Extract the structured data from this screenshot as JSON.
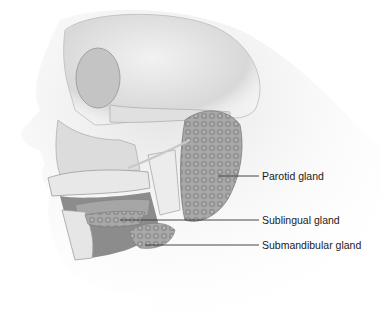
{
  "figure": {
    "labels": [
      {
        "id": "parotid",
        "text": "Parotid gland",
        "x": 262,
        "y": 170,
        "line": {
          "x1": 218,
          "x2": 259,
          "y": 176
        }
      },
      {
        "id": "sublingual",
        "text": "Sublingual gland",
        "x": 262,
        "y": 214,
        "line": {
          "x1": 120,
          "x2": 259,
          "y": 220
        }
      },
      {
        "id": "submandibular",
        "text": "Submandibular gland",
        "x": 262,
        "y": 238,
        "line": {
          "x1": 145,
          "x2": 259,
          "y": 245
        }
      }
    ],
    "colors": {
      "bone": "#e6e6e6",
      "gland": "#9a9a9a",
      "shadow": "#8a8a8a",
      "line": "#333333",
      "text": "#1a1a1a"
    }
  }
}
